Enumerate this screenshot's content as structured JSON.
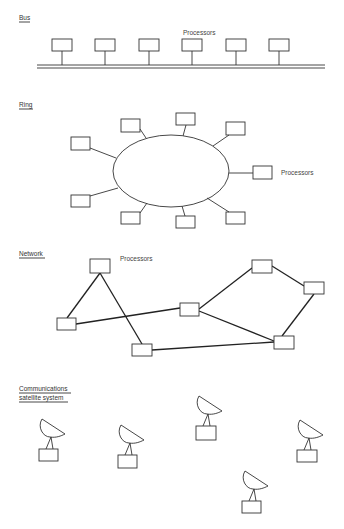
{
  "sections": {
    "bus": {
      "title": "Bus",
      "processors_label": "Processors",
      "processor_count": 6
    },
    "ring": {
      "title": "Ring",
      "processors_label": "Processors",
      "processor_count": 9
    },
    "network": {
      "title": "Network",
      "processors_label": "Processors",
      "processor_count": 7
    },
    "satellite": {
      "title_line1": "Communications",
      "title_line2": "satellite system",
      "station_count": 5
    }
  },
  "colors": {
    "stroke": "#333333",
    "background": "#ffffff"
  }
}
